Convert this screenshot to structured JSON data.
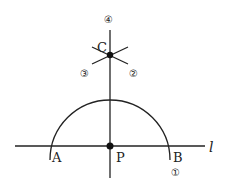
{
  "diagram": {
    "points": {
      "A": "A",
      "B": "B",
      "C": "C",
      "P": "P"
    },
    "line_label": "l",
    "step_labels": [
      "①",
      "②",
      "③",
      "④"
    ]
  }
}
